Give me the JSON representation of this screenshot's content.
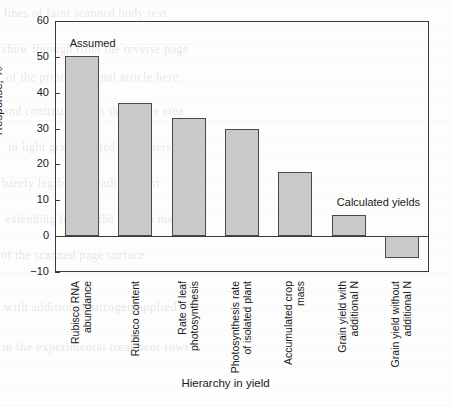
{
  "chart_data": {
    "type": "bar",
    "title": "",
    "xlabel": "Hierarchy in yield",
    "ylabel": "Response, %",
    "ylim": [
      -10,
      60
    ],
    "yticks": [
      -10,
      0,
      10,
      20,
      30,
      40,
      50,
      60
    ],
    "ytick_labels": [
      "-10",
      "0",
      "10",
      "20",
      "30",
      "40",
      "50",
      "60"
    ],
    "grid": false,
    "legend": "none",
    "bar_color": "#c9c9c9",
    "bar_edge_color": "#4a4a4a",
    "categories": [
      "Rubisco RNA abundance",
      "Rubisco content",
      "Rate of leaf photosynthesis",
      "Photosynthesis rate of isolated plant",
      "Accumulated crop mass",
      "Grain yield with additional N",
      "Grain yield without additional N"
    ],
    "category_lines": [
      [
        "Rubisco RNA",
        "abundance"
      ],
      [
        "Rubisco content",
        ""
      ],
      [
        "Rate of leaf",
        "photosynthesis"
      ],
      [
        "Photosynthesis rate",
        "of isolated plant"
      ],
      [
        "Accumulated crop",
        "mass"
      ],
      [
        "Grain yield with",
        "additional N"
      ],
      [
        "Grain yield without",
        "additional N"
      ]
    ],
    "values": [
      50.3,
      37.2,
      33.0,
      29.8,
      17.8,
      6.0,
      -6.2
    ],
    "annotations": [
      {
        "text": "Assumed",
        "value_ref": 0
      },
      {
        "text": "Calculated yields",
        "value_ref": 5
      }
    ]
  },
  "background_text": [
    "lines of faint scanned body text",
    "show through from the reverse page",
    "of the printed journal article here",
    "and continue across the figure area",
    "in light gray ghosted characters",
    "barely legible beneath the plot",
    "extending toward the bottom margin",
    "of the scanned page surface",
    "with additional nitrogen applied",
    "in the experimental treatment rows"
  ]
}
